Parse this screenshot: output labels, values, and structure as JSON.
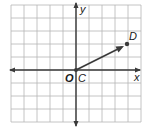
{
  "figure": {
    "type": "coordinate-plane-vector",
    "grid": {
      "x_range": [
        -5,
        5
      ],
      "y_range": [
        -4,
        5
      ],
      "cell_size_px": 13,
      "origin_px": [
        76,
        70
      ],
      "grid_color": "#b5b5b5",
      "axis_color": "#3a3a3a"
    },
    "axes": {
      "x_label": "x",
      "y_label": "y",
      "origin_label": "O"
    },
    "points": [
      {
        "name": "C",
        "label": "C",
        "x": 0,
        "y": 0
      },
      {
        "name": "D",
        "label": "D",
        "x": 4,
        "y": 2
      }
    ],
    "vector": {
      "from": "C",
      "to": "D",
      "color": "#3a3a3a"
    }
  }
}
